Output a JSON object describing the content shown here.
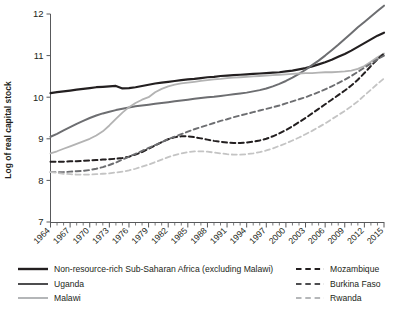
{
  "chart_data": {
    "type": "line",
    "title": "",
    "xlabel": "",
    "ylabel": "Log of real capital stock",
    "xlim": [
      1964,
      2015
    ],
    "ylim": [
      7,
      12
    ],
    "y_ticks": [
      7,
      8,
      9,
      10,
      11,
      12
    ],
    "x_tick_labels": [
      "1964",
      "1967",
      "1970",
      "1973",
      "1976",
      "1979",
      "1982",
      "1985",
      "1988",
      "1991",
      "1994",
      "1997",
      "2000",
      "2003",
      "2006",
      "2009",
      "2012",
      "2015"
    ],
    "x_minor_tick_interval": 1,
    "grid": false,
    "legend_position": "bottom",
    "x": [
      1964,
      1965,
      1966,
      1967,
      1968,
      1969,
      1970,
      1971,
      1972,
      1973,
      1974,
      1975,
      1976,
      1977,
      1978,
      1979,
      1980,
      1981,
      1982,
      1983,
      1984,
      1985,
      1986,
      1987,
      1988,
      1989,
      1990,
      1991,
      1992,
      1993,
      1994,
      1995,
      1996,
      1997,
      1998,
      1999,
      2000,
      2001,
      2002,
      2003,
      2004,
      2005,
      2006,
      2007,
      2008,
      2009,
      2010,
      2011,
      2012,
      2013,
      2014,
      2015
    ],
    "series": [
      {
        "name": "Non-resource-rich Sub-Saharan Africa (excluding Malawi)",
        "style": "solid",
        "color": "#231f20",
        "width": 2.2,
        "values": [
          10.1,
          10.12,
          10.14,
          10.16,
          10.18,
          10.2,
          10.22,
          10.24,
          10.25,
          10.26,
          10.27,
          10.21,
          10.22,
          10.24,
          10.27,
          10.3,
          10.33,
          10.35,
          10.37,
          10.39,
          10.41,
          10.43,
          10.44,
          10.46,
          10.48,
          10.49,
          10.51,
          10.52,
          10.53,
          10.54,
          10.55,
          10.56,
          10.57,
          10.58,
          10.59,
          10.6,
          10.62,
          10.64,
          10.67,
          10.7,
          10.74,
          10.79,
          10.84,
          10.9,
          10.97,
          11.04,
          11.12,
          11.21,
          11.3,
          11.39,
          11.48,
          11.55
        ]
      },
      {
        "name": "Uganda",
        "style": "solid",
        "color": "#6d6e71",
        "width": 2.0,
        "values": [
          9.05,
          9.12,
          9.2,
          9.28,
          9.36,
          9.43,
          9.5,
          9.56,
          9.61,
          9.65,
          9.69,
          9.72,
          9.75,
          9.78,
          9.8,
          9.82,
          9.84,
          9.86,
          9.88,
          9.9,
          9.92,
          9.94,
          9.96,
          9.98,
          10.0,
          10.01,
          10.03,
          10.05,
          10.07,
          10.09,
          10.11,
          10.14,
          10.17,
          10.21,
          10.26,
          10.32,
          10.39,
          10.47,
          10.56,
          10.66,
          10.77,
          10.88,
          11.0,
          11.13,
          11.26,
          11.4,
          11.54,
          11.68,
          11.81,
          11.94,
          12.07,
          12.2
        ]
      },
      {
        "name": "Malawi",
        "style": "solid",
        "color": "#b3b3b3",
        "width": 1.8,
        "values": [
          8.65,
          8.7,
          8.76,
          8.82,
          8.88,
          8.94,
          9.0,
          9.08,
          9.18,
          9.32,
          9.48,
          9.63,
          9.76,
          9.86,
          9.94,
          10.0,
          10.12,
          10.2,
          10.26,
          10.3,
          10.33,
          10.35,
          10.37,
          10.39,
          10.41,
          10.43,
          10.44,
          10.46,
          10.47,
          10.48,
          10.49,
          10.5,
          10.51,
          10.52,
          10.53,
          10.54,
          10.55,
          10.56,
          10.57,
          10.58,
          10.58,
          10.59,
          10.6,
          10.6,
          10.61,
          10.62,
          10.64,
          10.68,
          10.75,
          10.85,
          10.96,
          11.05
        ]
      },
      {
        "name": "Mozambique",
        "style": "dashed",
        "color": "#231f20",
        "width": 2.0,
        "values": [
          8.45,
          8.45,
          8.45,
          8.46,
          8.46,
          8.47,
          8.48,
          8.49,
          8.5,
          8.51,
          8.52,
          8.54,
          8.57,
          8.62,
          8.68,
          8.76,
          8.84,
          8.92,
          8.99,
          9.04,
          9.06,
          9.06,
          9.04,
          9.01,
          8.98,
          8.95,
          8.93,
          8.91,
          8.9,
          8.9,
          8.91,
          8.93,
          8.96,
          9.0,
          9.06,
          9.13,
          9.21,
          9.3,
          9.4,
          9.5,
          9.61,
          9.72,
          9.83,
          9.94,
          10.05,
          10.16,
          10.28,
          10.42,
          10.58,
          10.75,
          10.91,
          11.05
        ]
      },
      {
        "name": "Burkina Faso",
        "style": "dashed",
        "color": "#6d6e71",
        "width": 1.9,
        "values": [
          8.2,
          8.2,
          8.2,
          8.21,
          8.22,
          8.23,
          8.25,
          8.28,
          8.32,
          8.37,
          8.43,
          8.5,
          8.57,
          8.64,
          8.71,
          8.78,
          8.85,
          8.92,
          8.99,
          9.05,
          9.11,
          9.17,
          9.23,
          9.28,
          9.33,
          9.38,
          9.43,
          9.47,
          9.52,
          9.56,
          9.6,
          9.64,
          9.68,
          9.72,
          9.76,
          9.8,
          9.85,
          9.9,
          9.95,
          10.0,
          10.06,
          10.12,
          10.19,
          10.26,
          10.34,
          10.42,
          10.51,
          10.61,
          10.71,
          10.81,
          10.91,
          11.0
        ]
      },
      {
        "name": "Rwanda",
        "style": "dashed",
        "color": "#c4c4c4",
        "width": 1.8,
        "values": [
          8.2,
          8.18,
          8.16,
          8.15,
          8.14,
          8.14,
          8.14,
          8.15,
          8.16,
          8.17,
          8.19,
          8.21,
          8.24,
          8.28,
          8.33,
          8.38,
          8.44,
          8.5,
          8.56,
          8.61,
          8.65,
          8.68,
          8.7,
          8.7,
          8.69,
          8.67,
          8.65,
          8.63,
          8.62,
          8.62,
          8.63,
          8.65,
          8.68,
          8.72,
          8.77,
          8.83,
          8.89,
          8.96,
          9.03,
          9.11,
          9.19,
          9.28,
          9.37,
          9.47,
          9.57,
          9.67,
          9.78,
          9.9,
          10.04,
          10.18,
          10.32,
          10.45
        ]
      }
    ]
  },
  "legend": {
    "entries": [
      {
        "label": "Non-resource-rich Sub-Saharan Africa (excluding Malawi)",
        "style": "solid",
        "color": "#231f20",
        "width": 2.4,
        "column": "left",
        "row": 0
      },
      {
        "label": "Uganda",
        "style": "solid",
        "color": "#4d4d4f",
        "width": 2.0,
        "column": "left",
        "row": 1
      },
      {
        "label": "Malawi",
        "style": "solid",
        "color": "#a7a9ac",
        "width": 1.7,
        "column": "left",
        "row": 2
      },
      {
        "label": "Mozambique",
        "style": "dashed",
        "color": "#231f20",
        "width": 2.2,
        "column": "right",
        "row": 0
      },
      {
        "label": "Burkina Faso",
        "style": "dashed",
        "color": "#4d4d4f",
        "width": 2.0,
        "column": "right",
        "row": 1
      },
      {
        "label": "Rwanda",
        "style": "dashed",
        "color": "#b5b7b9",
        "width": 1.8,
        "column": "right",
        "row": 2
      }
    ]
  },
  "axis": {
    "y_title": "Log of real capital stock"
  }
}
